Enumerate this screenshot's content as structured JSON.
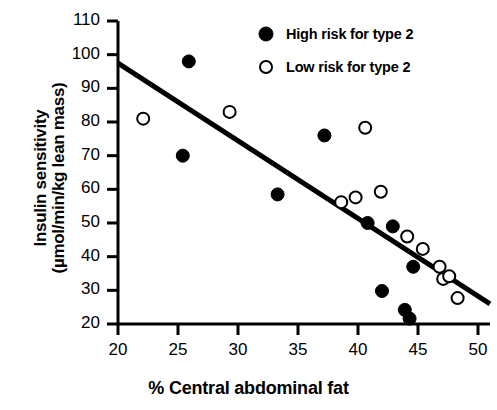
{
  "chart_data": {
    "type": "scatter",
    "title": "",
    "xlabel": "% Central abdominal fat",
    "ylabel_line1": "Insulin sensitivity",
    "ylabel_line2": "(µmol/min/kg lean mass)",
    "xlim": [
      20,
      51
    ],
    "ylim": [
      20,
      110
    ],
    "xticks": [
      20,
      25,
      30,
      35,
      40,
      45,
      50
    ],
    "xtick_labels": [
      "20",
      "25",
      "30",
      "35",
      "40",
      "45",
      "50"
    ],
    "yticks": [
      20,
      30,
      40,
      50,
      60,
      70,
      80,
      90,
      100,
      110
    ],
    "ytick_labels": [
      "20",
      "30",
      "40",
      "50",
      "60",
      "70",
      "80",
      "90",
      "100",
      "110"
    ],
    "grid": false,
    "legend_position": "top-right",
    "marker_color_filled": "#000000",
    "marker_edge_color": "#000000",
    "marker_face_open": "#ffffff",
    "trendline_color": "#000000",
    "series": [
      {
        "name": "High risk for type 2",
        "marker": "filled-circle",
        "points": [
          {
            "x": 25.9,
            "y": 98.0
          },
          {
            "x": 25.4,
            "y": 70.0
          },
          {
            "x": 37.2,
            "y": 76.0
          },
          {
            "x": 33.3,
            "y": 58.5
          },
          {
            "x": 40.8,
            "y": 50.0
          },
          {
            "x": 42.9,
            "y": 49.0
          },
          {
            "x": 44.6,
            "y": 37.0
          },
          {
            "x": 42.0,
            "y": 29.8
          },
          {
            "x": 43.9,
            "y": 24.2
          },
          {
            "x": 44.3,
            "y": 21.6
          }
        ]
      },
      {
        "name": "Low risk for type 2",
        "marker": "open-circle",
        "points": [
          {
            "x": 22.1,
            "y": 81.0
          },
          {
            "x": 29.3,
            "y": 83.0
          },
          {
            "x": 40.6,
            "y": 78.3
          },
          {
            "x": 38.6,
            "y": 56.2
          },
          {
            "x": 39.8,
            "y": 57.6
          },
          {
            "x": 41.9,
            "y": 59.3
          },
          {
            "x": 44.1,
            "y": 46.0
          },
          {
            "x": 45.4,
            "y": 42.3
          },
          {
            "x": 46.8,
            "y": 37.0
          },
          {
            "x": 47.1,
            "y": 33.4
          },
          {
            "x": 47.6,
            "y": 34.2
          },
          {
            "x": 48.3,
            "y": 27.7
          }
        ]
      }
    ],
    "trendline": {
      "name": "regression-line",
      "x_start": 20.0,
      "y_start": 97.5,
      "x_end": 51.0,
      "y_end": 26.0
    }
  },
  "legend": {
    "items": [
      {
        "label": "High risk for type 2",
        "marker": "filled-circle"
      },
      {
        "label": "Low risk for type 2",
        "marker": "open-circle"
      }
    ]
  }
}
